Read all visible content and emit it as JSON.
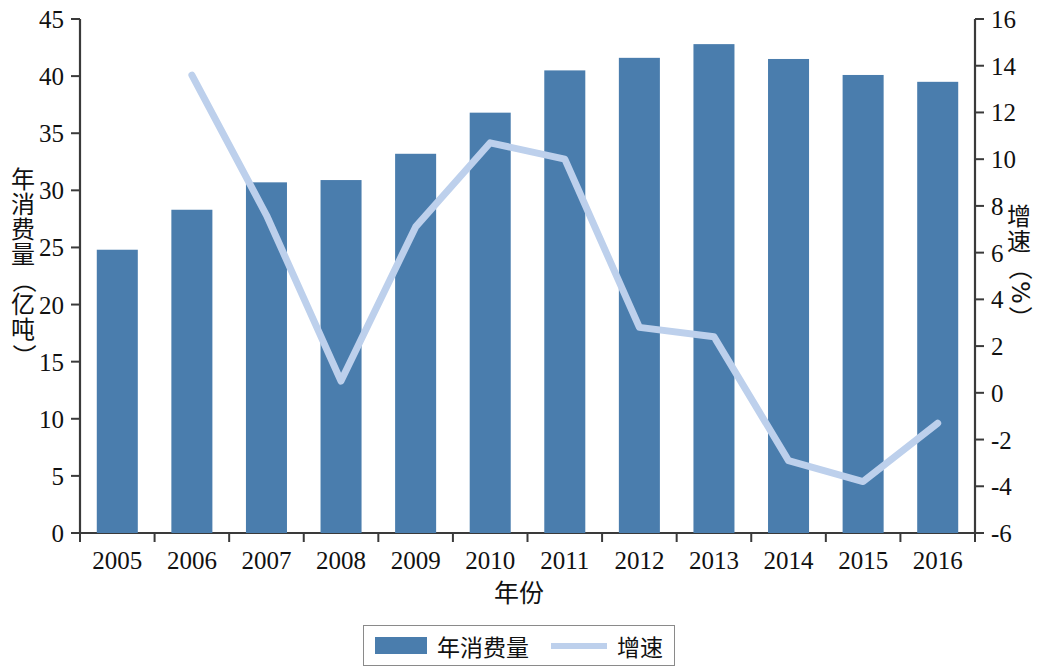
{
  "chart_data": {
    "type": "bar",
    "title": "",
    "xlabel": "年份",
    "ylabel": "年消费量（亿吨）",
    "y2label": "增速（%）",
    "categories": [
      "2005",
      "2006",
      "2007",
      "2008",
      "2009",
      "2010",
      "2011",
      "2012",
      "2013",
      "2014",
      "2015",
      "2016"
    ],
    "ylim": [
      0,
      45
    ],
    "y2lim": [
      -6,
      16
    ],
    "yticks": [
      "0",
      "5",
      "10",
      "15",
      "20",
      "25",
      "30",
      "35",
      "40",
      "45"
    ],
    "y2ticks": [
      "-6",
      "-4",
      "-2",
      "0",
      "2",
      "4",
      "6",
      "8",
      "10",
      "12",
      "14",
      "16"
    ],
    "grid": false,
    "legend_position": "bottom",
    "series": [
      {
        "name": "年消费量",
        "type": "bar",
        "axis": "left",
        "color": "#4a7dad",
        "values": [
          24.8,
          28.3,
          30.7,
          30.9,
          33.2,
          36.8,
          40.5,
          41.6,
          42.8,
          41.5,
          40.1,
          39.5
        ]
      },
      {
        "name": "增速",
        "type": "line",
        "axis": "right",
        "color": "#bdd0ec",
        "values": [
          null,
          13.6,
          7.6,
          0.5,
          7.1,
          10.7,
          10.0,
          2.8,
          2.4,
          -2.9,
          -3.8,
          -1.3
        ]
      }
    ]
  },
  "legend": {
    "bar_label": "年消费量",
    "line_label": "增速"
  },
  "axes": {
    "x_title": "年份",
    "y_left_title_chars": [
      "年",
      "消",
      "费",
      "量",
      "（",
      "亿",
      "吨",
      "）"
    ],
    "y_right_title_chars": [
      "增",
      "速",
      "（",
      "%",
      "）"
    ]
  },
  "colors": {
    "bar": "#4a7dad",
    "line": "#bdd0ec",
    "axis": "#3a3a3a",
    "text": "#111111"
  }
}
